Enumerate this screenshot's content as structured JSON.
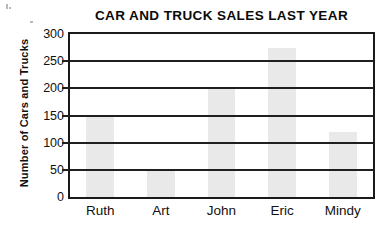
{
  "chart_data": {
    "type": "bar",
    "title": "CAR AND TRUCK SALES LAST YEAR",
    "xlabel": "",
    "ylabel": "Number of Cars and Trucks",
    "categories": [
      "Ruth",
      "Art",
      "John",
      "Eric",
      "Mindy"
    ],
    "values": [
      150,
      50,
      200,
      275,
      120
    ],
    "series": [
      {
        "name": "Number of Cars and Trucks",
        "values": [
          150,
          50,
          200,
          275,
          120
        ]
      }
    ],
    "ylim": [
      0,
      300
    ],
    "ytick_values": [
      0,
      50,
      100,
      150,
      200,
      250,
      300
    ],
    "ytick_labels": [
      "0",
      "50",
      "100",
      "150",
      "200",
      "250",
      "300"
    ],
    "grid": true,
    "grid_axis": "y",
    "legend": false,
    "legend_position": "none",
    "bar_color": "#e9e9e9",
    "axis_color": "#1a1a1a",
    "grid_color": "#1f1f1f",
    "text_color": "#111111",
    "background_color": "#ffffff"
  }
}
